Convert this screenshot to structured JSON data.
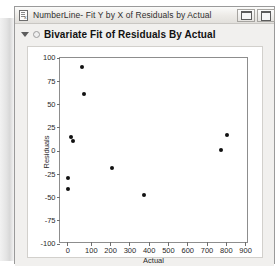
{
  "window": {
    "title": "NumberLine- Fit Y by X of Residuals by Actual",
    "icon_name": "jmp-report-icon",
    "controls": [
      {
        "name": "minimize-button",
        "glyph": "minimize"
      },
      {
        "name": "maximize-button",
        "glyph": "maximize"
      }
    ]
  },
  "report": {
    "title": "Bivariate Fit of Residuals By Actual",
    "disclosure_expanded": true
  },
  "chart_data": {
    "type": "scatter",
    "title": "Bivariate Fit of Residuals By Actual",
    "xlabel": "Actual",
    "ylabel": "Residuals",
    "xlim": [
      -30,
      950
    ],
    "ylim": [
      -100,
      100
    ],
    "xticks": [
      0,
      100,
      200,
      300,
      400,
      500,
      600,
      700,
      800,
      900
    ],
    "yticks": [
      100,
      75,
      50,
      25,
      0,
      -25,
      -50,
      -75,
      -100
    ],
    "grid": false,
    "legend": null,
    "marker_color": "#111111",
    "points": [
      {
        "x": 84,
        "y": 90
      },
      {
        "x": 94,
        "y": 61
      },
      {
        "x": 26,
        "y": 15
      },
      {
        "x": 37,
        "y": 11
      },
      {
        "x": 10,
        "y": -29
      },
      {
        "x": 10,
        "y": -41
      },
      {
        "x": 241,
        "y": -18
      },
      {
        "x": 408,
        "y": -47
      },
      {
        "x": 838,
        "y": 17
      },
      {
        "x": 806,
        "y": 1
      }
    ]
  },
  "colors": {
    "window_chrome": "#f1f0ee",
    "plot_background": "#ffffff",
    "axis": "#8d8d8d",
    "text": "#2a2a2a"
  }
}
